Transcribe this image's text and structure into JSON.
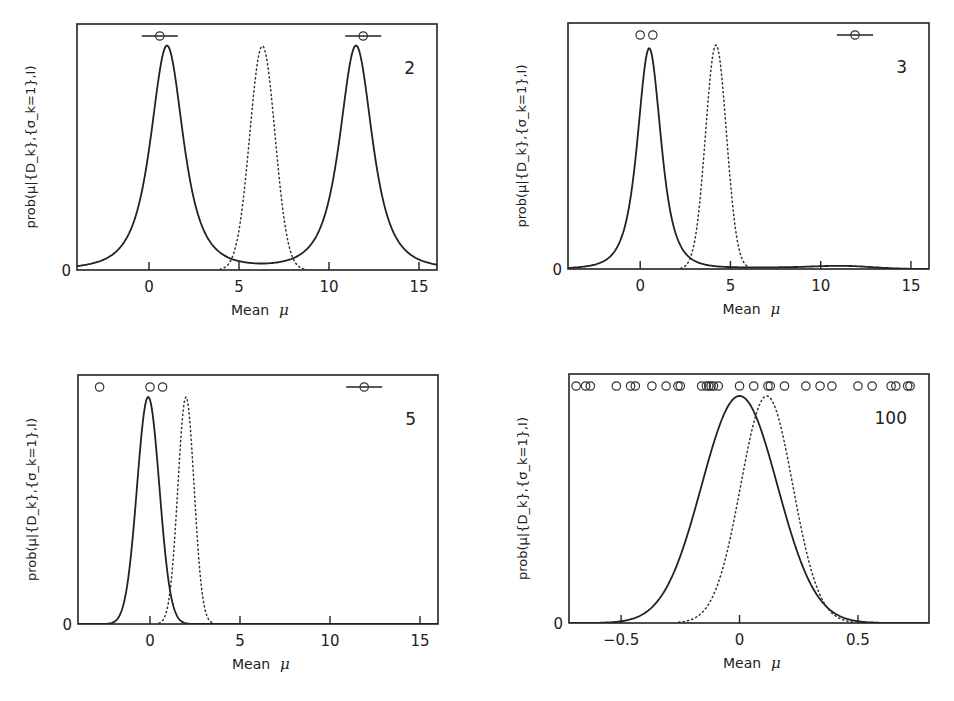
{
  "figure": {
    "x_axis_label": "Mean",
    "x_axis_symbol": "μ",
    "y_axis_label": "prob(μ|{D_k},{σ_k=1},I)",
    "y_zero_label": "0"
  },
  "panels": [
    {
      "n_label": "2",
      "xticks": [
        "0",
        "5",
        "10",
        "15"
      ]
    },
    {
      "n_label": "3",
      "xticks": [
        "0",
        "5",
        "10",
        "15"
      ]
    },
    {
      "n_label": "5",
      "xticks": [
        "0",
        "5",
        "10",
        "15"
      ]
    },
    {
      "n_label": "100",
      "xticks": [
        "−0.5",
        "0",
        "0.5"
      ]
    }
  ],
  "chart_data": [
    {
      "type": "line",
      "title": "N = 2",
      "xlabel": "Mean μ",
      "ylabel": "prob(μ|{D_k},{σ_k=1},I)",
      "xlim": [
        -4,
        16
      ],
      "xticks": [
        0,
        5,
        10,
        15
      ],
      "yticks": [
        0
      ],
      "grid": false,
      "data_points_x": [
        0.6,
        11.9
      ],
      "data_error_bars": true,
      "series": [
        {
          "name": "posterior (solid)",
          "style": "solid",
          "shape": "bimodal",
          "peaks": [
            1.0,
            11.5
          ],
          "min_at": 6.3,
          "min_relative_height": 0.24
        },
        {
          "name": "gaussian (dotted)",
          "style": "dotted",
          "center": 6.3,
          "sigma": 0.7
        }
      ]
    },
    {
      "type": "line",
      "title": "N = 3",
      "xlabel": "Mean μ",
      "ylabel": "prob(μ|{D_k},{σ_k=1},I)",
      "xlim": [
        -4,
        16
      ],
      "xticks": [
        0,
        5,
        10,
        15
      ],
      "yticks": [
        0
      ],
      "grid": false,
      "data_points_x": [
        0.0,
        0.7,
        11.9
      ],
      "data_error_bars": [
        false,
        false,
        true
      ],
      "series": [
        {
          "name": "posterior (solid)",
          "style": "solid",
          "peak": 0.5,
          "secondary_bump": 11.5
        },
        {
          "name": "gaussian (dotted)",
          "style": "dotted",
          "center": 4.2,
          "sigma": 0.58
        }
      ]
    },
    {
      "type": "line",
      "title": "N = 5",
      "xlabel": "Mean μ",
      "ylabel": "prob(μ|{D_k},{σ_k=1},I)",
      "xlim": [
        -4,
        16
      ],
      "xticks": [
        0,
        5,
        10,
        15
      ],
      "yticks": [
        0
      ],
      "grid": false,
      "data_points_x": [
        -2.8,
        0.0,
        0.7,
        11.9
      ],
      "data_error_bars": [
        false,
        false,
        false,
        true
      ],
      "series": [
        {
          "name": "posterior (solid)",
          "style": "solid",
          "peak": -0.1
        },
        {
          "name": "gaussian (dotted)",
          "style": "dotted",
          "center": 2.0,
          "sigma": 0.45
        }
      ]
    },
    {
      "type": "line",
      "title": "N = 100",
      "xlabel": "Mean μ",
      "ylabel": "prob(μ|{D_k},{σ_k=1},I)",
      "xlim": [
        -0.72,
        0.8
      ],
      "xticks": [
        -0.5,
        0,
        0.5
      ],
      "yticks": [
        0
      ],
      "grid": false,
      "data_points_x": [
        -0.69,
        -0.65,
        -0.63,
        -0.52,
        -0.46,
        -0.44,
        -0.37,
        -0.31,
        -0.26,
        -0.25,
        -0.16,
        -0.14,
        -0.13,
        -0.12,
        -0.11,
        -0.09,
        0.0,
        0.06,
        0.12,
        0.13,
        0.19,
        0.28,
        0.34,
        0.39,
        0.5,
        0.56,
        0.64,
        0.66,
        0.71,
        0.72
      ],
      "series": [
        {
          "name": "posterior (solid)",
          "style": "solid",
          "center": 0.0,
          "sigma": 0.16
        },
        {
          "name": "gaussian (dotted)",
          "style": "dotted",
          "center": 0.115,
          "sigma": 0.11
        }
      ]
    }
  ]
}
